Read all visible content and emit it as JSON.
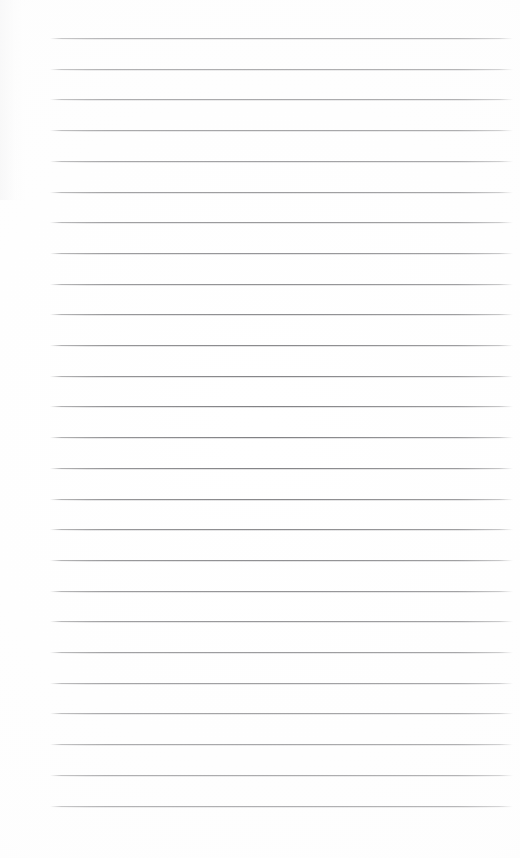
{
  "document": {
    "type": "ruled-notebook-page",
    "title": "Blank ruled page",
    "page_width": 520,
    "page_height": 858,
    "background_color": "#ffffff",
    "text_content": "",
    "has_text": false,
    "has_header": false,
    "has_page_number": false,
    "has_margin_line": false
  },
  "rules": {
    "count": 26,
    "color": "#808083",
    "thickness_px": 1,
    "first_line_y": 38,
    "last_line_y": 806,
    "spacing_px": 30.7,
    "line_start_x": 50,
    "line_end_x": 513,
    "line_length_px": 463,
    "positions_y": [
      38,
      68.7,
      99.4,
      130.1,
      160.8,
      191.5,
      222.2,
      252.9,
      283.6,
      314.3,
      345,
      375.7,
      406.4,
      437.1,
      467.8,
      498.5,
      529.2,
      559.9,
      590.6,
      621.3,
      652,
      682.7,
      713.4,
      744.1,
      774.8,
      805.5
    ]
  },
  "margins": {
    "left_px": 50,
    "right_px": 7,
    "top_px": 38,
    "bottom_px": 52
  }
}
